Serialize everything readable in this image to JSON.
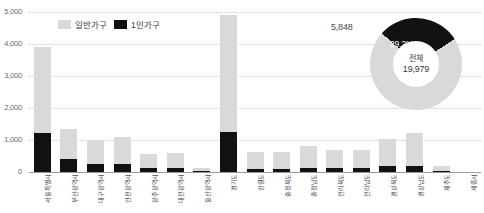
{
  "legend": {
    "items": [
      {
        "label": "일반가구",
        "color": "#d9d9d9",
        "icon": "square-swatch-icon"
      },
      {
        "label": "1인가구",
        "color": "#111111",
        "icon": "square-swatch-icon"
      }
    ]
  },
  "donut": {
    "callout_value": "5,848",
    "percent_label": "29.2%",
    "center_title": "전체",
    "center_value": "19,979",
    "single_color": "#111111",
    "total_color": "#d9d9d9"
  },
  "chart_data": {
    "type": "bar",
    "title": "",
    "xlabel": "",
    "ylabel": "",
    "ylim": [
      0,
      5000
    ],
    "yticks": [
      "0",
      "1,000",
      "2,000",
      "3,000",
      "4,000",
      "5,000"
    ],
    "grid": true,
    "stacked": true,
    "legend_position": "top-left",
    "categories": [
      "서울특별시",
      "부산광역시",
      "대구광역시",
      "인천광역시",
      "광주광역시",
      "대전광역시",
      "울산광역시",
      "경기도",
      "강원도",
      "충청북도",
      "충청남도",
      "전라북도",
      "전라남도",
      "경상북도",
      "경상남도",
      "제주도",
      "세종시"
    ],
    "series": [
      {
        "name": "일반가구",
        "color": "#d9d9d9",
        "values": [
          3900,
          1350,
          960,
          1080,
          560,
          580,
          120,
          4900,
          620,
          620,
          810,
          680,
          700,
          1020,
          1230,
          200,
          0
        ]
      },
      {
        "name": "1인가구",
        "color": "#111111",
        "values": [
          1230,
          400,
          250,
          250,
          120,
          130,
          30,
          1250,
          90,
          80,
          130,
          120,
          120,
          180,
          200,
          30,
          0
        ]
      }
    ],
    "donut": {
      "type": "doughnut",
      "labels": [
        "1인가구",
        "그외 일반가구"
      ],
      "values": [
        5848,
        14131
      ],
      "total": 19979,
      "percent": 29.2
    }
  }
}
